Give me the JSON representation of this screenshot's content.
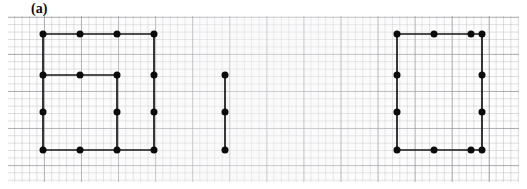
{
  "figure": {
    "label": "(a)",
    "caption_position": "top-left",
    "background": "#ffffff",
    "ink_color": "#0b0b0b",
    "grid": {
      "visible": true,
      "type": "graph-paper",
      "minor_cell_px": 7.42,
      "major_cell_px": 37.1,
      "minor_color": "#a8a4ac",
      "major_color": "#787880",
      "panel": {
        "x": 8,
        "y": 16,
        "width": 511,
        "height": 166
      }
    },
    "lattice": {
      "origin_x": 43,
      "origin_y": 34,
      "step_x": 37,
      "step_y": 38.7
    },
    "shapes": [
      {
        "name": "left-polyline-figure",
        "vertex_count": 15,
        "vertices": [
          {
            "id": "L-r0c0",
            "x": 43,
            "y": 34
          },
          {
            "id": "L-r0c1",
            "x": 80,
            "y": 34
          },
          {
            "id": "L-r0c2",
            "x": 117,
            "y": 34
          },
          {
            "id": "L-r0c3",
            "x": 154,
            "y": 34
          },
          {
            "id": "L-r1c0",
            "x": 43,
            "y": 75
          },
          {
            "id": "L-r1c1",
            "x": 80,
            "y": 75
          },
          {
            "id": "L-r1c2",
            "x": 117,
            "y": 75
          },
          {
            "id": "L-r1c3",
            "x": 154,
            "y": 75
          },
          {
            "id": "L-r2c0",
            "x": 43,
            "y": 112
          },
          {
            "id": "L-r2c2",
            "x": 117,
            "y": 112
          },
          {
            "id": "L-r2c3",
            "x": 154,
            "y": 112
          },
          {
            "id": "L-r3c0",
            "x": 43,
            "y": 150
          },
          {
            "id": "L-r3c1",
            "x": 80,
            "y": 150
          },
          {
            "id": "L-r3c2",
            "x": 117,
            "y": 150
          },
          {
            "id": "L-r3c3",
            "x": 154,
            "y": 150
          }
        ],
        "edges": [
          {
            "id": "L-e1",
            "x1": 43,
            "y1": 34,
            "x2": 154,
            "y2": 34
          },
          {
            "id": "L-e2",
            "x1": 43,
            "y1": 34,
            "x2": 43,
            "y2": 150
          },
          {
            "id": "L-e3",
            "x1": 43,
            "y1": 75,
            "x2": 117,
            "y2": 75
          },
          {
            "id": "L-e4",
            "x1": 117,
            "y1": 75,
            "x2": 117,
            "y2": 150
          },
          {
            "id": "L-e5",
            "x1": 43,
            "y1": 150,
            "x2": 154,
            "y2": 150
          },
          {
            "id": "L-e6",
            "x1": 154,
            "y1": 34,
            "x2": 154,
            "y2": 150
          }
        ]
      },
      {
        "name": "middle-segment-figure",
        "vertex_count": 3,
        "vertices": [
          {
            "id": "M-v0",
            "x": 225,
            "y": 75
          },
          {
            "id": "M-v1",
            "x": 225,
            "y": 112
          },
          {
            "id": "M-v2",
            "x": 225,
            "y": 150
          }
        ],
        "edges": [
          {
            "id": "M-e1",
            "x1": 225,
            "y1": 75,
            "x2": 225,
            "y2": 150
          }
        ]
      },
      {
        "name": "right-rectangle-figure",
        "vertex_count": 12,
        "vertices": [
          {
            "id": "R-r0c0",
            "x": 397,
            "y": 34
          },
          {
            "id": "R-r0c1",
            "x": 434,
            "y": 34
          },
          {
            "id": "R-r0c2",
            "x": 471,
            "y": 34
          },
          {
            "id": "R-r0c3",
            "x": 482,
            "y": 34
          },
          {
            "id": "R-r1c0",
            "x": 397,
            "y": 75
          },
          {
            "id": "R-r1c3",
            "x": 482,
            "y": 75
          },
          {
            "id": "R-r2c0",
            "x": 397,
            "y": 112
          },
          {
            "id": "R-r2c3",
            "x": 482,
            "y": 112
          },
          {
            "id": "R-r3c0",
            "x": 397,
            "y": 150
          },
          {
            "id": "R-r3c1",
            "x": 434,
            "y": 150
          },
          {
            "id": "R-r3c2",
            "x": 471,
            "y": 150
          },
          {
            "id": "R-r3c3",
            "x": 482,
            "y": 150
          }
        ],
        "edges": [
          {
            "id": "R-e1",
            "x1": 397,
            "y1": 34,
            "x2": 482,
            "y2": 34
          },
          {
            "id": "R-e2",
            "x1": 482,
            "y1": 34,
            "x2": 482,
            "y2": 150
          },
          {
            "id": "R-e3",
            "x1": 482,
            "y1": 150,
            "x2": 397,
            "y2": 150
          },
          {
            "id": "R-e4",
            "x1": 397,
            "y1": 150,
            "x2": 397,
            "y2": 34
          }
        ]
      }
    ],
    "vertex_radius": 3.5,
    "edge_width": 1.7
  }
}
